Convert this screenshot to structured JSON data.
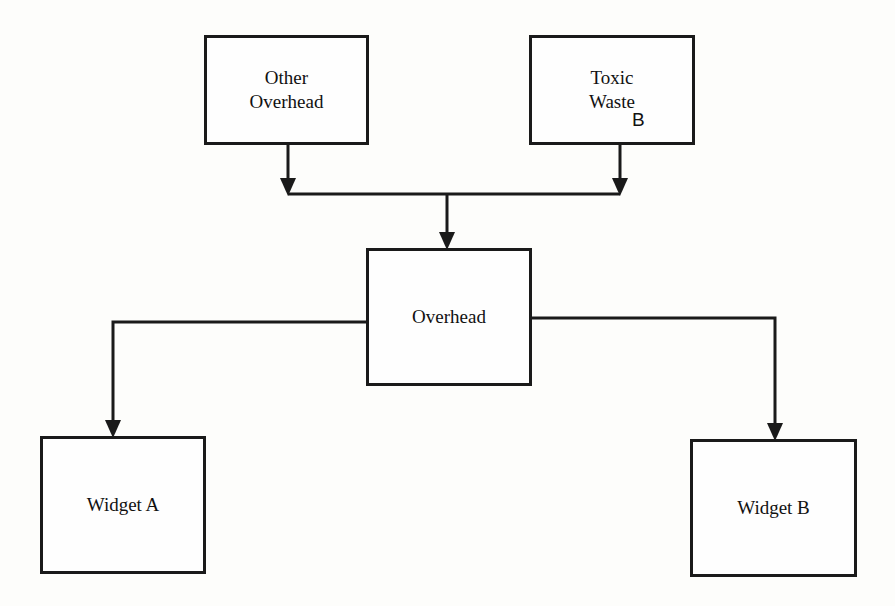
{
  "diagram": {
    "type": "cost-allocation-flow",
    "nodes": {
      "other_overhead": {
        "line1": "Other",
        "line2": "Overhead"
      },
      "toxic_waste": {
        "line1": "Toxic",
        "line2": "Waste",
        "annotation": "B"
      },
      "overhead": {
        "label": "Overhead"
      },
      "widget_a": {
        "label": "Widget A"
      },
      "widget_b": {
        "label": "Widget B"
      }
    },
    "edges": [
      {
        "from": "Other Overhead",
        "to": "Overhead"
      },
      {
        "from": "Toxic Waste",
        "to": "Overhead"
      },
      {
        "from": "Overhead",
        "to": "Widget A"
      },
      {
        "from": "Overhead",
        "to": "Widget B"
      }
    ],
    "colors": {
      "line": "#1a1a1a",
      "background": "#fdfdfb"
    }
  }
}
